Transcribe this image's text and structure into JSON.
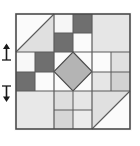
{
  "figure": {
    "width": 140,
    "height": 146,
    "block": {
      "x": 14,
      "y": 12,
      "width": 118,
      "height": 119,
      "grid_columns": 3,
      "grid_rows": 3
    },
    "palette": {
      "background": "#ffffff",
      "white": "#fbfbfb",
      "light_gray": "#e4e4e4",
      "mid_light_gray": "#d2d2d2",
      "mid_gray": "#b4b4b4",
      "dark_gray": "#6f6f6f",
      "outline": "#4a4a4a",
      "seam": "#5a5a5a",
      "marker": "#1a1a1a"
    },
    "units": [
      {
        "id": "unit-top-left",
        "name": "half-square-triangle-top-left",
        "row": 1,
        "column": 1,
        "type": "half-square-triangle",
        "orientation": "diagonal-from-bottom-left-to-top-right",
        "upper_fill": "white",
        "lower_fill": "light_gray"
      },
      {
        "id": "unit-top-center",
        "name": "four-patch-top-center",
        "row": 1,
        "column": 2,
        "type": "four-patch",
        "patch_fills": [
          "white",
          "dark_gray",
          "dark_gray",
          "white"
        ]
      },
      {
        "id": "unit-top-right",
        "name": "plain-square-top-right",
        "row": 1,
        "column": 3,
        "type": "plain-square",
        "fill": "light_gray"
      },
      {
        "id": "unit-middle-left",
        "name": "four-patch-middle-left",
        "row": 2,
        "column": 1,
        "type": "four-patch",
        "patch_fills": [
          "white",
          "dark_gray",
          "dark_gray",
          "white"
        ]
      },
      {
        "id": "unit-middle-center",
        "name": "square-in-a-square-center",
        "row": 2,
        "column": 2,
        "type": "square-in-a-square",
        "corner_fill": "white",
        "diamond_fill": "mid_gray"
      },
      {
        "id": "unit-middle-right",
        "name": "four-patch-middle-right",
        "row": 2,
        "column": 3,
        "type": "four-patch",
        "patch_fills": [
          "white",
          "light_gray",
          "light_gray",
          "mid_light_gray"
        ]
      },
      {
        "id": "unit-bottom-left",
        "name": "plain-square-bottom-left",
        "row": 3,
        "column": 1,
        "type": "plain-square",
        "fill": "light_gray"
      },
      {
        "id": "unit-bottom-center",
        "name": "four-patch-bottom-center",
        "row": 3,
        "column": 2,
        "type": "four-patch",
        "patch_fills": [
          "mid_light_gray",
          "light_gray",
          "mid_light_gray",
          "light_gray"
        ]
      },
      {
        "id": "unit-bottom-right",
        "name": "half-square-triangle-bottom-right",
        "row": 3,
        "column": 3,
        "type": "half-square-triangle",
        "orientation": "diagonal-from-top-left-to-bottom-right",
        "upper_fill": "light_gray",
        "lower_fill": "white"
      }
    ],
    "markers": [
      {
        "id": "marker-upper",
        "name": "arrow-marker-upper",
        "edge": "left",
        "y": 52,
        "direction": "up",
        "label": ""
      },
      {
        "id": "marker-lower",
        "name": "arrow-marker-lower",
        "edge": "left",
        "y": 93,
        "direction": "down",
        "label": ""
      }
    ]
  }
}
